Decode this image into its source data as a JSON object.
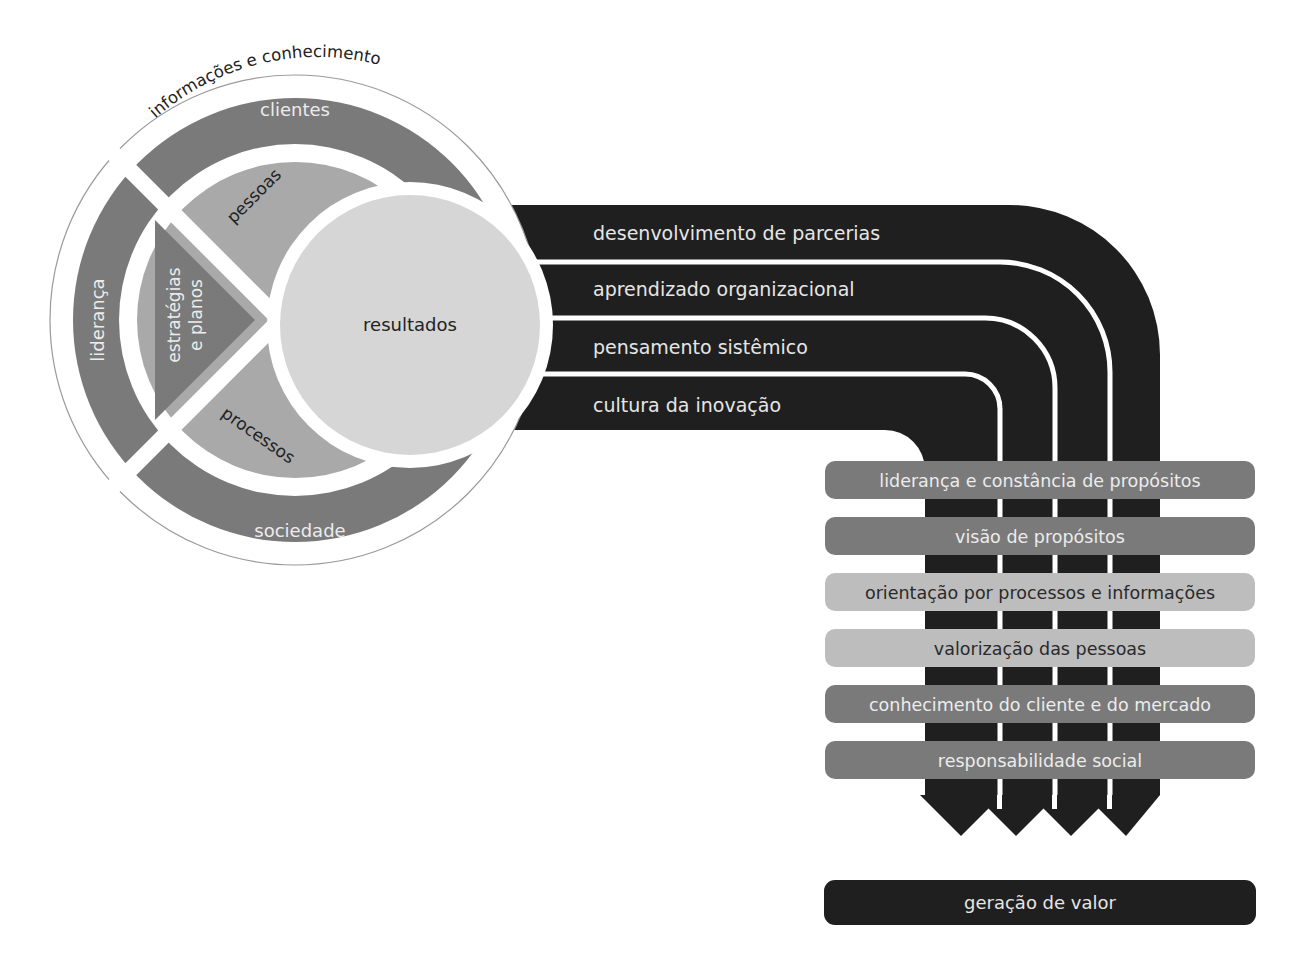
{
  "colors": {
    "dark": "#1f1f1f",
    "mid": "#7a7a7a",
    "light": "#a9a9a9",
    "lighter": "#bdbdbd",
    "pale": "#d6d6d6",
    "white": "#ffffff"
  },
  "circle": {
    "outer_ring_label": "informações e conhecimento",
    "outer_segments": {
      "top": "clientes",
      "left": "liderança",
      "bottom": "sociedade"
    },
    "inner_segments": {
      "top": "pessoas",
      "left_line1": "estratégias",
      "left_line2": "e planos",
      "bottom": "processos"
    },
    "center": "resultados"
  },
  "bands": [
    "desenvolvimento de parcerias",
    "aprendizado organizacional",
    "pensamento sistêmico",
    "cultura da inovação"
  ],
  "principles": [
    {
      "label": "liderança e constância de propósitos",
      "tone": "mid"
    },
    {
      "label": "visão de propósitos",
      "tone": "mid"
    },
    {
      "label": "orientação por processos e informações",
      "tone": "lighter"
    },
    {
      "label": "valorização das pessoas",
      "tone": "lighter"
    },
    {
      "label": "conhecimento do cliente e do mercado",
      "tone": "mid"
    },
    {
      "label": "responsabilidade social",
      "tone": "mid"
    }
  ],
  "outcome": "geração de valor"
}
